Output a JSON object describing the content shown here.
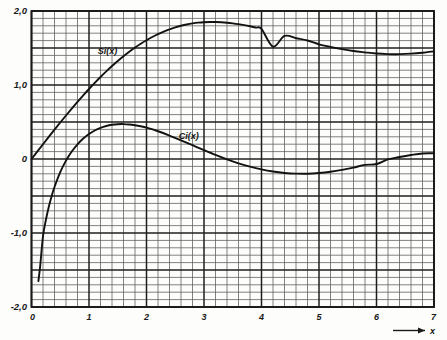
{
  "figure": {
    "name": "sine-integral-cosine-integral-plot",
    "background_color": "#fdfdfc",
    "ink_color": "#1a1a1a",
    "grid_minor_color": "#5a5a5a",
    "grid_major_color": "#1f1f1f"
  },
  "chart_data": {
    "type": "line",
    "title": "",
    "subtitle": "",
    "xlabel": "x",
    "ylabel": "",
    "xlim": [
      0,
      7
    ],
    "ylim": [
      -2.0,
      2.0
    ],
    "grid": true,
    "grid_minor_x_step": 0.2,
    "grid_minor_y_step": 0.1,
    "grid_major_x_step": 1.0,
    "grid_major_y_step": 0.5,
    "legend_position": "inline-curve-labels",
    "x_tick_labels": [
      "0",
      "1",
      "2",
      "3",
      "4",
      "5",
      "6",
      "7"
    ],
    "x_tick_values": [
      0,
      1,
      2,
      3,
      4,
      5,
      6,
      7
    ],
    "y_tick_labels": [
      "2,0",
      "1,0",
      "0",
      "-1,0",
      "-2,0"
    ],
    "y_tick_values": [
      2.0,
      1.0,
      0,
      -1.0,
      -2.0
    ],
    "x_axis_arrow": true,
    "series": [
      {
        "name": "Si(x)",
        "label": "Si(x)",
        "label_x": 1.15,
        "label_y": 1.42,
        "color": "#121212",
        "x": [
          0,
          0.1,
          0.2,
          0.3,
          0.4,
          0.5,
          0.6,
          0.7,
          0.8,
          0.9,
          1.0,
          1.1,
          1.2,
          1.3,
          1.4,
          1.5,
          1.6,
          1.7,
          1.8,
          1.9,
          2.0,
          2.1,
          2.2,
          2.3,
          2.4,
          2.5,
          2.6,
          2.7,
          2.8,
          2.9,
          3.0,
          3.1,
          3.2,
          3.3,
          3.4,
          3.5,
          3.6,
          3.7,
          3.8,
          3.9,
          4.0,
          4.2,
          4.4,
          4.6,
          4.8,
          5.0,
          5.2,
          5.4,
          5.6,
          5.8,
          6.0,
          6.2,
          6.4,
          6.6,
          6.8,
          7.0
        ],
        "y": [
          0,
          0.09994,
          0.19956,
          0.2985,
          0.39646,
          0.49311,
          0.58813,
          0.68122,
          0.7721,
          0.86047,
          0.94608,
          1.02869,
          1.10805,
          1.18396,
          1.25623,
          1.32468,
          1.38918,
          1.44959,
          1.50582,
          1.55778,
          1.60541,
          1.6487,
          1.68762,
          1.72221,
          1.75249,
          1.77852,
          1.80039,
          1.81821,
          1.8321,
          1.84219,
          1.84865,
          1.85166,
          1.8514,
          1.84808,
          1.84191,
          1.83313,
          1.82195,
          1.80862,
          1.79339,
          1.7765,
          1.7582,
          1.51851,
          1.66384,
          1.63246,
          1.60083,
          1.54993,
          1.5151,
          1.48483,
          1.45997,
          1.44125,
          1.42469,
          1.41742,
          1.41692,
          1.42342,
          1.43668,
          1.4546
        ],
        "note_peak": {
          "x": 3.14159,
          "y": 1.8519
        },
        "note_min_right": {
          "x": 6.28,
          "y": 1.4182
        },
        "note_start": {
          "x": 0,
          "y": 0
        }
      },
      {
        "name": "Ci(x)",
        "label": "Ci(x)",
        "label_x": 2.56,
        "label_y": 0.27,
        "color": "#121212",
        "x": [
          0.12,
          0.15,
          0.2,
          0.25,
          0.3,
          0.35,
          0.4,
          0.5,
          0.6,
          0.7,
          0.8,
          0.9,
          1.0,
          1.1,
          1.2,
          1.3,
          1.4,
          1.5,
          1.6,
          1.7,
          1.8,
          1.9,
          2.0,
          2.2,
          2.4,
          2.6,
          2.8,
          3.0,
          3.2,
          3.4,
          3.6,
          3.8,
          4.0,
          4.2,
          4.4,
          4.6,
          4.8,
          5.0,
          5.2,
          5.4,
          5.6,
          5.8,
          6.0,
          6.2,
          6.4,
          6.6,
          6.8,
          7.0
        ],
        "y": [
          -1.6492,
          -1.4546,
          -1.0422,
          -0.8247,
          -0.6492,
          -0.5032,
          -0.3788,
          -0.1778,
          -0.0223,
          0.1005,
          0.1983,
          0.2761,
          0.3374,
          0.3849,
          0.4205,
          0.4457,
          0.462,
          0.4704,
          0.4717,
          0.467,
          0.4568,
          0.4419,
          0.423,
          0.3751,
          0.3173,
          0.2533,
          0.1859,
          0.1196,
          0.0553,
          -0.0045,
          -0.058,
          -0.1038,
          -0.141,
          -0.1692,
          -0.1883,
          -0.1983,
          -0.1995,
          -0.19,
          -0.1729,
          -0.1477,
          -0.1162,
          -0.08,
          -0.0681,
          -0.0048,
          0.0263,
          0.0533,
          0.0751,
          0.0767
        ],
        "note_peak": {
          "x": 1.57,
          "y": 0.472
        },
        "note_zero_crossing": {
          "x": 3.384,
          "y": 0
        },
        "note_min_right": {
          "x": 4.74,
          "y": -0.1997
        },
        "note_start": {
          "x": 0.12,
          "y": -1.6492
        }
      }
    ]
  }
}
